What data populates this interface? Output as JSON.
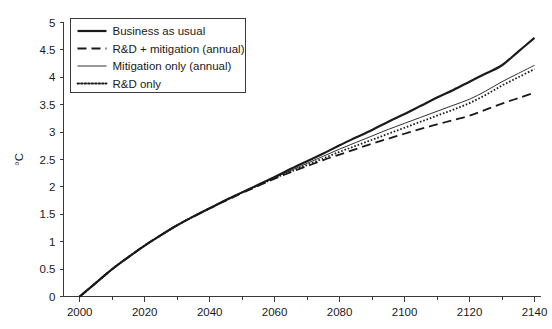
{
  "chart_data": {
    "type": "line",
    "title": "",
    "subtitle": "",
    "xlabel": "",
    "ylabel": "°C",
    "xlim": [
      1995,
      2142
    ],
    "ylim": [
      0,
      5
    ],
    "grid": false,
    "legend_position": "top-left",
    "x_ticks": [
      2000,
      2020,
      2040,
      2060,
      2080,
      2100,
      2120,
      2140
    ],
    "x_tick_labels": [
      "2000",
      "2020",
      "2040",
      "2060",
      "2080",
      "2100",
      "2120",
      "2140"
    ],
    "x_minor_ticks": [
      2010,
      2030,
      2050,
      2070,
      2090,
      2110,
      2130
    ],
    "y_ticks": [
      0,
      0.5,
      1,
      1.5,
      2,
      2.5,
      3,
      3.5,
      4,
      4.5,
      5
    ],
    "y_tick_labels": [
      "0",
      "0.5",
      "1",
      "1.5",
      "2",
      "2.5",
      "3",
      "3.5",
      "4",
      "4.5",
      "5"
    ],
    "x": [
      2000,
      2005,
      2010,
      2015,
      2020,
      2025,
      2030,
      2035,
      2040,
      2045,
      2050,
      2055,
      2060,
      2065,
      2070,
      2075,
      2080,
      2085,
      2090,
      2095,
      2100,
      2105,
      2110,
      2115,
      2120,
      2125,
      2130,
      2135,
      2140
    ],
    "series": [
      {
        "name": "Business as usual",
        "style": "solid-thick",
        "color": "#1a1a1a",
        "values": [
          0.0,
          0.25,
          0.5,
          0.72,
          0.93,
          1.12,
          1.3,
          1.46,
          1.61,
          1.76,
          1.9,
          2.04,
          2.18,
          2.33,
          2.47,
          2.61,
          2.76,
          2.9,
          3.04,
          3.19,
          3.33,
          3.48,
          3.63,
          3.77,
          3.92,
          4.07,
          4.22,
          4.47,
          4.72
        ]
      },
      {
        "name": "R&D + mitigation (annual)",
        "style": "dashed",
        "color": "#1a1a1a",
        "values": [
          0.0,
          0.25,
          0.5,
          0.72,
          0.93,
          1.12,
          1.3,
          1.46,
          1.61,
          1.75,
          1.89,
          2.02,
          2.15,
          2.27,
          2.38,
          2.49,
          2.59,
          2.69,
          2.79,
          2.88,
          2.97,
          3.06,
          3.14,
          3.22,
          3.3,
          3.41,
          3.52,
          3.62,
          3.72
        ]
      },
      {
        "name": "Mitigation only (annual)",
        "style": "solid-thin",
        "color": "#1a1a1a",
        "values": [
          0.0,
          0.25,
          0.5,
          0.72,
          0.93,
          1.12,
          1.3,
          1.46,
          1.61,
          1.76,
          1.9,
          2.03,
          2.17,
          2.3,
          2.43,
          2.56,
          2.69,
          2.81,
          2.93,
          3.05,
          3.16,
          3.27,
          3.38,
          3.49,
          3.6,
          3.75,
          3.92,
          4.07,
          4.22
        ]
      },
      {
        "name": "R&D only",
        "style": "dotted",
        "color": "#1a1a1a",
        "values": [
          0.0,
          0.25,
          0.5,
          0.72,
          0.93,
          1.12,
          1.3,
          1.46,
          1.61,
          1.76,
          1.9,
          2.03,
          2.16,
          2.28,
          2.4,
          2.52,
          2.64,
          2.75,
          2.86,
          2.97,
          3.08,
          3.19,
          3.3,
          3.41,
          3.53,
          3.68,
          3.85,
          4.0,
          4.15
        ]
      }
    ]
  },
  "legend": {
    "items": [
      {
        "label": "Business as usual",
        "style": "solid-thick"
      },
      {
        "label": "R&D + mitigation (annual)",
        "style": "dashed"
      },
      {
        "label": "Mitigation only (annual)",
        "style": "solid-thin"
      },
      {
        "label": "R&D only",
        "style": "dotted"
      }
    ]
  },
  "axis": {
    "y_title": "°C"
  },
  "colors": {
    "ink": "#1a1a1a",
    "axis": "#3a3a3a",
    "background": "#ffffff"
  }
}
